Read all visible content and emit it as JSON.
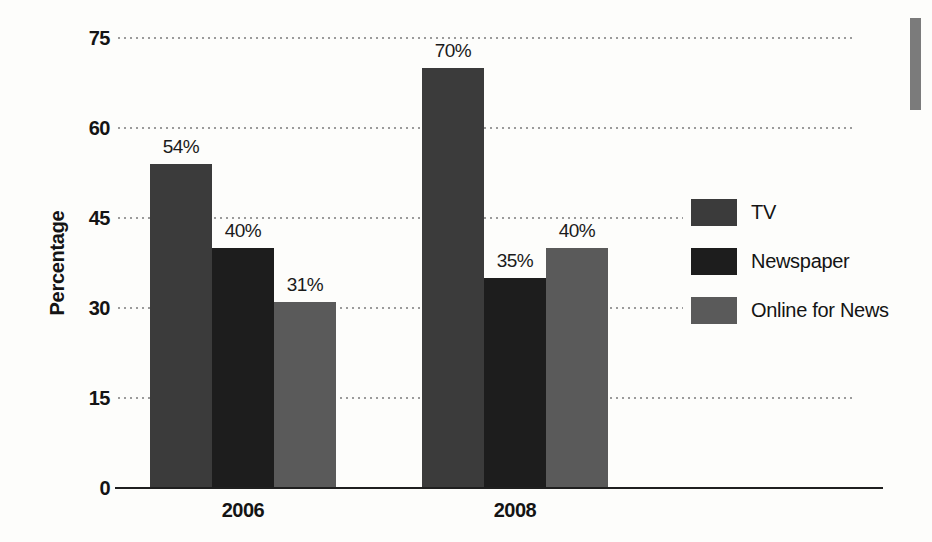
{
  "figure": {
    "background": "#fdfdfb",
    "page_margin_bar_color": "#7b7b7b"
  },
  "chart_data": {
    "type": "bar",
    "categories": [
      "2006",
      "2008"
    ],
    "series": [
      {
        "name": "TV",
        "color": "#3b3b3b",
        "values": [
          54,
          70
        ]
      },
      {
        "name": "Newspaper",
        "color": "#1d1d1d",
        "values": [
          40,
          35
        ]
      },
      {
        "name": "Online for News",
        "color": "#5a5a5a",
        "values": [
          31,
          40
        ]
      }
    ],
    "value_labels": [
      [
        "54%",
        "40%",
        "31%"
      ],
      [
        "70%",
        "35%",
        "40%"
      ]
    ],
    "title": "",
    "xlabel": "",
    "ylabel": "Percentage",
    "yticks": [
      0,
      15,
      30,
      45,
      60,
      75
    ],
    "ylim": [
      0,
      81
    ],
    "grid": "dotted-horizontal",
    "legend_position": "right"
  }
}
